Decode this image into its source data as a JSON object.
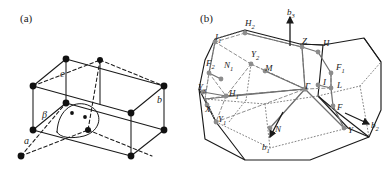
{
  "figure": {
    "panels": [
      {
        "id": "a",
        "caption": "(a)",
        "type": "crystal-unit-cell",
        "lattice": "base-centered monoclinic",
        "axis_labels": [
          {
            "name": "a",
            "text": "a"
          },
          {
            "name": "b",
            "text": "b"
          },
          {
            "name": "c",
            "text": "c"
          }
        ],
        "angle_labels": [
          {
            "name": "beta",
            "text": "β"
          }
        ]
      },
      {
        "id": "b",
        "caption": "(b)",
        "type": "brillouin-zone",
        "reciprocal_axis_labels": [
          {
            "name": "b1",
            "base": "b",
            "sub": "1"
          },
          {
            "name": "b2",
            "base": "b",
            "sub": "2"
          },
          {
            "name": "b3",
            "base": "b",
            "sub": "3"
          }
        ],
        "high_symmetry_points": [
          {
            "name": "gamma",
            "base": "Γ",
            "sub": "",
            "x": 305,
            "y": 89
          },
          {
            "name": "z",
            "base": "Z",
            "sub": "",
            "x": 302,
            "y": 44
          },
          {
            "name": "m",
            "base": "M",
            "sub": "",
            "x": 265,
            "y": 71
          },
          {
            "name": "h",
            "base": "H",
            "sub": "",
            "x": 323,
            "y": 46
          },
          {
            "name": "h1",
            "base": "H",
            "sub": "1",
            "x": 229,
            "y": 96
          },
          {
            "name": "h2",
            "base": "H",
            "sub": "2",
            "x": 245,
            "y": 26
          },
          {
            "name": "i",
            "base": "I",
            "sub": "",
            "x": 323,
            "y": 85
          },
          {
            "name": "i1",
            "base": "I",
            "sub": "1",
            "x": 215,
            "y": 40
          },
          {
            "name": "l",
            "base": "L",
            "sub": "",
            "x": 337,
            "y": 88
          },
          {
            "name": "f",
            "base": "F",
            "sub": "",
            "x": 337,
            "y": 110
          },
          {
            "name": "f1",
            "base": "F",
            "sub": "1",
            "x": 336,
            "y": 70
          },
          {
            "name": "f2",
            "base": "F",
            "sub": "2",
            "x": 206,
            "y": 66
          },
          {
            "name": "n",
            "base": "N",
            "sub": "",
            "x": 275,
            "y": 132
          },
          {
            "name": "n1",
            "base": "N",
            "sub": "1",
            "x": 224,
            "y": 68
          },
          {
            "name": "x",
            "base": "X",
            "sub": "",
            "x": 205,
            "y": 112
          },
          {
            "name": "y",
            "base": "Y",
            "sub": "",
            "x": 348,
            "y": 133
          },
          {
            "name": "y1",
            "base": "Y",
            "sub": "1",
            "x": 218,
            "y": 122
          },
          {
            "name": "y2",
            "base": "Y",
            "sub": "2",
            "x": 251,
            "y": 57
          },
          {
            "name": "y3",
            "base": "Y",
            "sub": "3",
            "x": 198,
            "y": 90
          }
        ]
      }
    ],
    "colors": {
      "line": "#1a1a1a",
      "marker_cell": "#111111",
      "marker_bz": "#8c8c8c",
      "guide": "#9a9a9a",
      "background": "#ffffff"
    }
  }
}
